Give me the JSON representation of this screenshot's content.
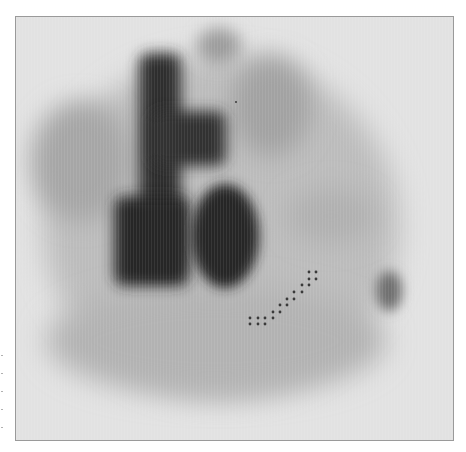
{
  "image": {
    "kind": "grayscale nuclear medicine scan (scintigraphy), anterior view",
    "background_color": "#e2e2e2",
    "frame_border_color": "#9a9a9a",
    "frame": {
      "x": 15,
      "y": 16,
      "width": 439,
      "height": 425
    }
  },
  "regions": [
    {
      "name": "outer-body-halo",
      "shape": "ellipse",
      "cx": 220,
      "cy": 225,
      "rx": 178,
      "ry": 170,
      "color": "#bcbcbc",
      "blur": 14
    },
    {
      "name": "lower-body-band",
      "shape": "ellipse",
      "cx": 215,
      "cy": 340,
      "rx": 170,
      "ry": 55,
      "color": "#b2b2b2",
      "blur": 14
    },
    {
      "name": "top-bump",
      "shape": "ellipse",
      "cx": 218,
      "cy": 45,
      "rx": 22,
      "ry": 18,
      "color": "#9c9c9c",
      "blur": 8
    },
    {
      "name": "upper-left-lobe",
      "shape": "ellipse",
      "cx": 80,
      "cy": 160,
      "rx": 50,
      "ry": 60,
      "color": "#a6a6a6",
      "blur": 12
    },
    {
      "name": "upper-right-lobe",
      "shape": "ellipse",
      "cx": 270,
      "cy": 105,
      "rx": 40,
      "ry": 50,
      "color": "#a2a2a2",
      "blur": 12
    },
    {
      "name": "right-mid-shadow",
      "shape": "ellipse",
      "cx": 330,
      "cy": 215,
      "rx": 45,
      "ry": 28,
      "color": "#b0b0b0",
      "blur": 12
    },
    {
      "name": "vertical-column-dark",
      "shape": "rect",
      "x": 138,
      "y": 52,
      "w": 42,
      "h": 220,
      "color": "#2e2e2e",
      "blur": 7
    },
    {
      "name": "upper-crossbar-dark",
      "shape": "rect",
      "x": 150,
      "y": 110,
      "w": 75,
      "h": 55,
      "color": "#333333",
      "blur": 7
    },
    {
      "name": "left-lower-blob-dark",
      "shape": "rect",
      "x": 113,
      "y": 195,
      "w": 75,
      "h": 90,
      "color": "#272727",
      "blur": 7
    },
    {
      "name": "right-lower-blob-dark",
      "shape": "ellipse",
      "cx": 224,
      "cy": 235,
      "rx": 34,
      "ry": 52,
      "color": "#272727",
      "blur": 6
    },
    {
      "name": "right-edge-spot",
      "shape": "ellipse",
      "cx": 388,
      "cy": 290,
      "rx": 13,
      "ry": 20,
      "color": "#6e6e6e",
      "blur": 6
    }
  ],
  "markers": {
    "color": "#3a3a3a",
    "radius": 1.4,
    "points": [
      [
        249,
        317
      ],
      [
        257,
        317
      ],
      [
        264,
        317
      ],
      [
        272,
        317
      ],
      [
        249,
        323
      ],
      [
        257,
        323
      ],
      [
        264,
        323
      ],
      [
        272,
        311
      ],
      [
        279,
        311
      ],
      [
        279,
        304
      ],
      [
        286,
        304
      ],
      [
        286,
        298
      ],
      [
        293,
        298
      ],
      [
        293,
        291
      ],
      [
        301,
        291
      ],
      [
        301,
        284
      ],
      [
        308,
        284
      ],
      [
        308,
        278
      ],
      [
        315,
        278
      ],
      [
        308,
        271
      ],
      [
        315,
        271
      ]
    ],
    "single_dot": [
      235,
      101
    ]
  }
}
